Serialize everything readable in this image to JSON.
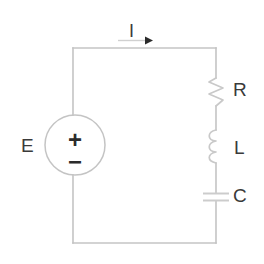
{
  "figure": {
    "background_color": "#ffffff",
    "wire_color": "#c4c4c4",
    "label_color": "#3a3a3a",
    "width": 264,
    "height": 264
  },
  "labels": {
    "source": "E",
    "current": "I",
    "resistor": "R",
    "inductor": "L",
    "capacitor": "C",
    "polarity_positive": "+",
    "polarity_negative": "−"
  },
  "components": [
    {
      "id": "voltage-source",
      "symbol": "circle-with-polarity",
      "label": "E",
      "position": "left-branch",
      "center": [
        75,
        145
      ],
      "radius": 30
    },
    {
      "id": "resistor",
      "symbol": "zigzag",
      "label": "R",
      "position": "right-branch-top",
      "span": [
        78,
        106
      ]
    },
    {
      "id": "inductor",
      "symbol": "coil",
      "label": "L",
      "position": "right-branch-middle",
      "span": [
        130,
        163
      ]
    },
    {
      "id": "capacitor",
      "symbol": "parallel-plates",
      "label": "C",
      "position": "right-branch-bottom",
      "span": [
        193,
        201
      ]
    }
  ],
  "current_arrow": {
    "label": "I",
    "direction": "right",
    "location": "top-wire",
    "from_x": 118,
    "to_x": 152,
    "y": 40
  },
  "loop": {
    "shape": "rectangle",
    "left_x": 73,
    "right_x": 216,
    "top_y": 48,
    "bottom_y": 243
  }
}
